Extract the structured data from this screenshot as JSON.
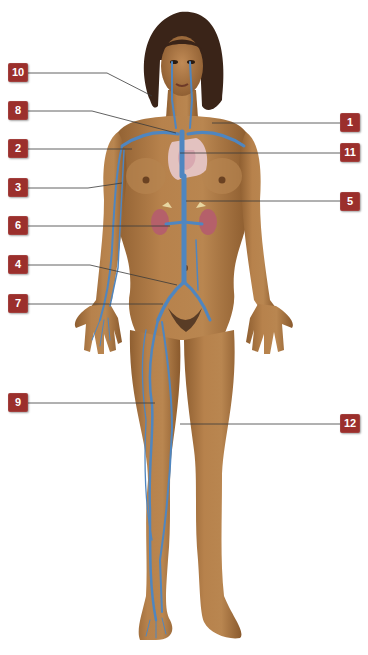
{
  "figure": {
    "colors": {
      "background": "#ffffff",
      "skin": "#b07a45",
      "skin_shadow": "#8a5a2e",
      "hair": "#3a2418",
      "vein": "#4f86c0",
      "kidney": "#b5606a",
      "heart_lung": "#e8c9cc",
      "callout_fill": "#9b2f2c",
      "callout_text": "#ffffff",
      "leader_line": "#3a3a3a"
    }
  },
  "callouts": [
    {
      "id": "10",
      "label": "10",
      "side": "left",
      "x": 8,
      "y": 63,
      "target": [
        152,
        96
      ]
    },
    {
      "id": "8",
      "label": "8",
      "side": "left",
      "x": 8,
      "y": 101,
      "target": [
        176,
        133
      ]
    },
    {
      "id": "2",
      "label": "2",
      "side": "left",
      "x": 8,
      "y": 139,
      "target": [
        132,
        148
      ]
    },
    {
      "id": "3",
      "label": "3",
      "side": "left",
      "x": 8,
      "y": 178,
      "target": [
        122,
        183
      ]
    },
    {
      "id": "6",
      "label": "6",
      "side": "left",
      "x": 8,
      "y": 216,
      "target": [
        170,
        224
      ]
    },
    {
      "id": "4",
      "label": "4",
      "side": "left",
      "x": 8,
      "y": 255,
      "target": [
        177,
        285
      ]
    },
    {
      "id": "7",
      "label": "7",
      "side": "left",
      "x": 8,
      "y": 294,
      "target": [
        163,
        304
      ]
    },
    {
      "id": "9",
      "label": "9",
      "side": "left",
      "x": 8,
      "y": 393,
      "target": [
        155,
        402
      ]
    },
    {
      "id": "1",
      "label": "1",
      "side": "right",
      "x": 340,
      "y": 113,
      "target": [
        212,
        122
      ]
    },
    {
      "id": "11",
      "label": "11",
      "side": "right",
      "x": 340,
      "y": 143,
      "target": [
        180,
        153
      ]
    },
    {
      "id": "5",
      "label": "5",
      "side": "right",
      "x": 340,
      "y": 192,
      "target": [
        186,
        200
      ]
    },
    {
      "id": "12",
      "label": "12",
      "side": "right",
      "x": 340,
      "y": 414,
      "target": [
        180,
        424
      ]
    }
  ]
}
